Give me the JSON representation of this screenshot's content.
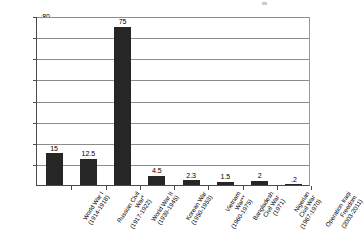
{
  "chart_data": {
    "type": "bar",
    "title": "",
    "xlabel": "",
    "ylabel": "Number of Casualties in Millions",
    "ylim": [
      0,
      80
    ],
    "ytick_values": [
      0,
      10,
      20,
      30,
      40,
      50,
      60,
      70,
      80
    ],
    "ytick_labels": [
      "",
      "10",
      "20",
      "30",
      "40",
      "50",
      "60",
      "70",
      "80"
    ],
    "grid": true,
    "legend": "none",
    "bar_color": "#262626",
    "categories": [
      "World War I (1914-1918)",
      "Russian Civil War* (1917-1922)",
      "World War II (1939-1945)",
      "Korean War (1950-1953)",
      "Vietnam War** (1960-1975)",
      "Bangladesh Civil War (1971)",
      "Nigerian Civil War (1967-1970)",
      "Operation Iraqi Freedom (2003-2011)"
    ],
    "values": [
      15,
      12.5,
      75,
      4.5,
      2.3,
      1.5,
      2,
      0.2
    ],
    "data_labels": [
      "15",
      "12.5",
      "75",
      "4.5",
      "2.3",
      "1.5",
      "2",
      ".2"
    ]
  },
  "axes": {
    "y_title": "Number of Casualties in Millions",
    "y_ticks": [
      {
        "label": "80",
        "value": 80
      },
      {
        "label": "70",
        "value": 70
      },
      {
        "label": "60",
        "value": 60
      },
      {
        "label": "50",
        "value": 50
      },
      {
        "label": "40",
        "value": 40
      },
      {
        "label": "30",
        "value": 30
      },
      {
        "label": "20",
        "value": 20
      },
      {
        "label": "10",
        "value": 10
      }
    ]
  },
  "x_categories": [
    {
      "line1": "World War I",
      "line2": "(1914-1918)"
    },
    {
      "line1": "Russian Civil",
      "line2": "War*",
      "line3": "(1917-1922)"
    },
    {
      "line1": "World War II",
      "line2": "(1939-1945)"
    },
    {
      "line1": "Korean War",
      "line2": "(1950-1953)"
    },
    {
      "line1": "Vietnam",
      "line2": "War**",
      "line3": "(1960-1975)"
    },
    {
      "line1": "Bangladesh",
      "line2": "Civil War",
      "line3": "(1971)"
    },
    {
      "line1": "Nigerian",
      "line2": "Civil War",
      "line3": "(1967-1970)"
    },
    {
      "line1": "Operation Iraqi",
      "line2": "Freedom",
      "line3": "(2003-2011)"
    }
  ],
  "bars": [
    {
      "label": "15"
    },
    {
      "label": "12.5"
    },
    {
      "label": "75"
    },
    {
      "label": "4.5"
    },
    {
      "label": "2.3"
    },
    {
      "label": "1.5"
    },
    {
      "label": "2"
    },
    {
      "label": ".2"
    }
  ]
}
